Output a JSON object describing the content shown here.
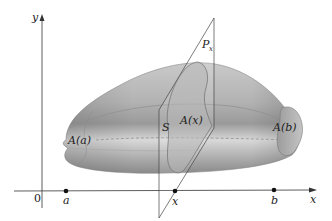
{
  "figure": {
    "axes": {
      "x_label": "x",
      "y_label": "y",
      "origin_label": "0"
    },
    "points": [
      {
        "name": "a",
        "label": "a"
      },
      {
        "name": "x",
        "label": "x"
      },
      {
        "name": "b",
        "label": "b"
      }
    ],
    "plane": {
      "label_main": "P",
      "label_sub": "x"
    },
    "solid": {
      "label": "S"
    },
    "cross_sections": {
      "left": "A(a)",
      "middle": "A(x)",
      "right": "A(b)"
    },
    "colors": {
      "solid_light": "#d4d4d4",
      "solid_mid": "#a9a9a9",
      "solid_dark": "#7d7d7d",
      "axis": "#333333",
      "plane_edge": "#444444"
    }
  }
}
